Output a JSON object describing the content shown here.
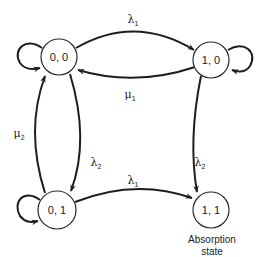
{
  "diagram": {
    "type": "state-transition",
    "nodes": [
      {
        "id": "s00",
        "label": "0, 0"
      },
      {
        "id": "s10",
        "label": "1, 0"
      },
      {
        "id": "s01",
        "label": "0, 1"
      },
      {
        "id": "s11",
        "label": "1, 1"
      }
    ],
    "edges": [
      {
        "from": "s00",
        "to": "s10",
        "symbol": "λ",
        "sub": "1"
      },
      {
        "from": "s10",
        "to": "s00",
        "symbol": "μ",
        "sub": "1"
      },
      {
        "from": "s00",
        "to": "s01",
        "symbol": "λ",
        "sub": "2"
      },
      {
        "from": "s01",
        "to": "s00",
        "symbol": "μ",
        "sub": "2"
      },
      {
        "from": "s10",
        "to": "s11",
        "symbol": "λ",
        "sub": "2"
      },
      {
        "from": "s01",
        "to": "s11",
        "symbol": "λ",
        "sub": "1"
      }
    ],
    "self_loops": [
      "s00",
      "s10",
      "s01"
    ],
    "caption_line1": "Absorption",
    "caption_line2": "state"
  }
}
